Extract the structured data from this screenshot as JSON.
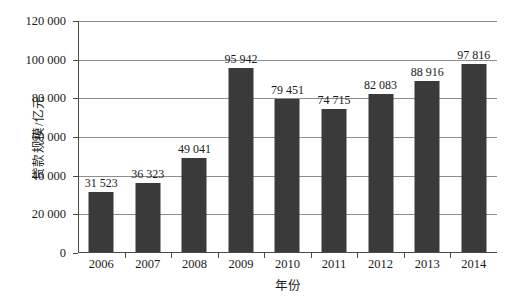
{
  "chart_data": {
    "type": "bar",
    "title": "",
    "xlabel": "年份",
    "ylabel": "贷款规模/亿元",
    "categories": [
      "2006",
      "2007",
      "2008",
      "2009",
      "2010",
      "2011",
      "2012",
      "2013",
      "2014"
    ],
    "values": [
      31523,
      36323,
      49041,
      95942,
      79451,
      74715,
      82083,
      88916,
      97816
    ],
    "value_labels": [
      "31 523",
      "36 323",
      "49 041",
      "95 942",
      "79 451",
      "74 715",
      "82 083",
      "88 916",
      "97 816"
    ],
    "ylim": [
      0,
      120000
    ],
    "ytick_values": [
      0,
      20000,
      40000,
      60000,
      80000,
      100000,
      120000
    ],
    "ytick_labels": [
      "0",
      "20 000",
      "40 000",
      "60 000",
      "80 000",
      "100 000",
      "120 000"
    ],
    "grid": true,
    "legend": "none",
    "bar_color": "#3a3a3a",
    "gridline_color": "#8d8d8d",
    "axis_color": "#4a4a4a",
    "background_color": "#ffffff"
  },
  "caption": {
    "text": ""
  }
}
